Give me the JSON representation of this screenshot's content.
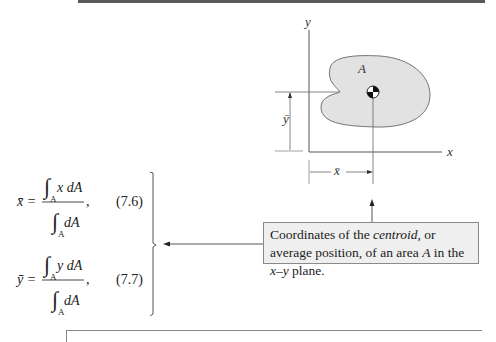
{
  "figure": {
    "axis_y_label": "y",
    "axis_x_label": "x",
    "area_label": "A",
    "ybar_label": "ȳ",
    "xbar_label": "x̄",
    "region_fill": "#e2e2e2",
    "line_color": "#555555"
  },
  "equations": [
    {
      "lhs": "x̄ =",
      "numerator": "x dA",
      "denominator": "dA",
      "subscript": "A",
      "number": "(7.6)"
    },
    {
      "lhs": "ȳ =",
      "numerator": "y dA",
      "denominator": "dA",
      "subscript": "A",
      "number": "(7.7)"
    }
  ],
  "caption": {
    "part1": "Coordinates of the ",
    "emph": "centroid",
    "part2": ", or average position, of an area ",
    "emph2": "A",
    "part3": " in the ",
    "emph3": "x–y",
    "part4": " plane.",
    "background": "#efefef"
  }
}
